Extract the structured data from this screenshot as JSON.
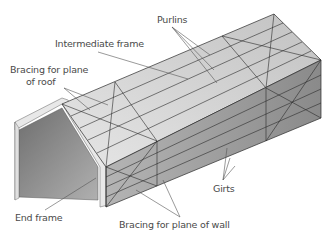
{
  "diagram": {
    "labels": {
      "purlins": "Purlins",
      "intermediate_frame": "Intermediate frame",
      "bracing_roof_line1": "Bracing for plane",
      "bracing_roof_line2": "of roof",
      "end_frame": "End frame",
      "girts": "Girts",
      "bracing_wall": "Bracing for plane of wall"
    },
    "colors": {
      "roof_fill": "#d4d4d4",
      "wall_fill": "#a8a8a8",
      "end_frame_fill": "#8c8c8c",
      "frame_edge": "#e8e8e8",
      "line": "#2a2a2a",
      "leader": "#555555",
      "text": "#4a4a4a"
    }
  }
}
